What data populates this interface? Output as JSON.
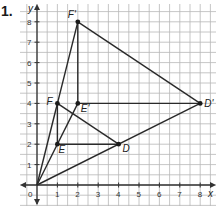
{
  "problem": {
    "number": "1."
  },
  "axes": {
    "x_label": "x",
    "y_label": "y",
    "origin_label": "0"
  },
  "x_ticks": [
    "1",
    "2",
    "3",
    "4",
    "5",
    "6",
    "7",
    "8"
  ],
  "y_ticks": [
    "1",
    "2",
    "3",
    "4",
    "5",
    "6",
    "7",
    "8"
  ],
  "points": {
    "O": {
      "label": "",
      "x": 0,
      "y": 0
    },
    "F": {
      "label": "F",
      "x": 1,
      "y": 4
    },
    "E": {
      "label": "E",
      "x": 1,
      "y": 2
    },
    "D": {
      "label": "D",
      "x": 4,
      "y": 2
    },
    "F_prime": {
      "label": "F'",
      "x": 2,
      "y": 8
    },
    "E_prime": {
      "label": "E'",
      "x": 2,
      "y": 4
    },
    "D_prime": {
      "label": "D'",
      "x": 8,
      "y": 4
    }
  },
  "segments": [
    [
      "O",
      "F_prime"
    ],
    [
      "O",
      "E_prime"
    ],
    [
      "O",
      "D_prime"
    ],
    [
      "F",
      "E"
    ],
    [
      "E",
      "D"
    ],
    [
      "F",
      "D"
    ],
    [
      "F_prime",
      "E_prime"
    ],
    [
      "E_prime",
      "D_prime"
    ],
    [
      "F_prime",
      "D_prime"
    ]
  ],
  "colors": {
    "grid": "#b8b8b8",
    "axis": "#333333",
    "line": "#2a2a2a"
  }
}
